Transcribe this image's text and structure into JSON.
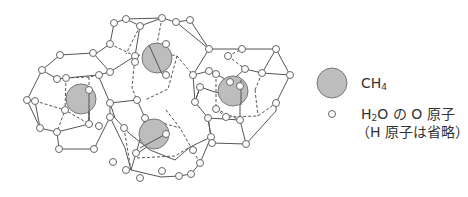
{
  "diagram": {
    "colors": {
      "line": "#555555",
      "node_fill": "#ffffff",
      "node_stroke": "#666666",
      "methane_fill": "#bdbdbd",
      "methane_stroke": "#777777"
    },
    "methane_molecules": [
      {
        "cx": 81,
        "cy": 99,
        "r": 15
      },
      {
        "cx": 157,
        "cy": 58,
        "r": 15
      },
      {
        "cx": 154,
        "cy": 134,
        "r": 15
      },
      {
        "cx": 233,
        "cy": 91,
        "r": 15
      }
    ]
  },
  "legend": {
    "items": [
      {
        "symbol": "large-gray-circle",
        "label_main": "CH",
        "label_sub": "4",
        "label_tail": ""
      },
      {
        "symbol": "small-white-circle",
        "line1_main": "H",
        "line1_sub": "2",
        "line1_tail": "O の O 原子",
        "line2": "（H 原子は省略）"
      }
    ]
  }
}
